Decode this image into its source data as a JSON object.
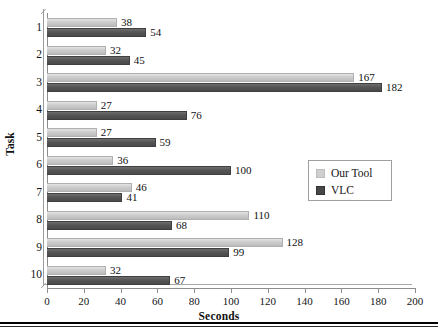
{
  "chart_data": {
    "type": "bar",
    "orientation": "horizontal",
    "title": "",
    "xlabel": "Seconds",
    "ylabel": "Task",
    "categories": [
      "1",
      "2",
      "3",
      "4",
      "5",
      "6",
      "7",
      "8",
      "9",
      "10"
    ],
    "series": [
      {
        "name": "Our Tool",
        "color": "#cccccc",
        "values": [
          38,
          32,
          167,
          27,
          27,
          36,
          46,
          110,
          128,
          32
        ]
      },
      {
        "name": "VLC",
        "color": "#4f4f4f",
        "values": [
          54,
          45,
          182,
          76,
          59,
          100,
          41,
          68,
          99,
          67
        ]
      }
    ],
    "xlim": [
      0,
      200
    ],
    "xticks": [
      0,
      20,
      40,
      60,
      80,
      100,
      120,
      140,
      160,
      180,
      200
    ],
    "grid": false,
    "legend_position": "center-right",
    "data_labels": true
  }
}
